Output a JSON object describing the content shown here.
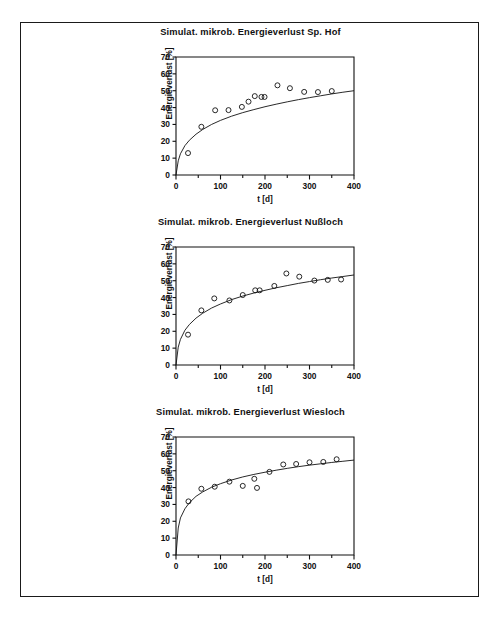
{
  "figure": {
    "border_color": "#1a1a1a",
    "background": "#ffffff",
    "panel_count": 3
  },
  "axis_labels": {
    "x": "t [d]",
    "y": "Energieverlust [%]"
  },
  "chart_data": [
    {
      "type": "scatter",
      "title": "Simulat. mikrob. Energieverlust Sp. Hof",
      "xlabel": "t [d]",
      "ylabel": "Energieverlust [%]",
      "xlim": [
        0,
        400
      ],
      "ylim": [
        0,
        70
      ],
      "xticks": [
        0,
        100,
        200,
        300,
        400
      ],
      "xtick_labels": [
        "0",
        "100",
        "200",
        "300",
        "400"
      ],
      "xminor_step": 50,
      "yticks": [
        0,
        10,
        20,
        30,
        40,
        50,
        60,
        70
      ],
      "ytick_labels": [
        "0",
        "10",
        "20",
        "30",
        "40",
        "50",
        "60",
        "70"
      ],
      "grid": false,
      "legend": "none",
      "marker": "open-circle",
      "points": [
        {
          "x": 27,
          "y": 13.0
        },
        {
          "x": 57,
          "y": 28.6
        },
        {
          "x": 88,
          "y": 38.4
        },
        {
          "x": 118,
          "y": 38.5
        },
        {
          "x": 148,
          "y": 40.4
        },
        {
          "x": 163,
          "y": 43.5
        },
        {
          "x": 177,
          "y": 46.8
        },
        {
          "x": 192,
          "y": 46.3
        },
        {
          "x": 199,
          "y": 46.3
        },
        {
          "x": 228,
          "y": 53.2
        },
        {
          "x": 256,
          "y": 51.5
        },
        {
          "x": 288,
          "y": 49.3
        },
        {
          "x": 319,
          "y": 49.2
        },
        {
          "x": 350,
          "y": 49.8
        }
      ],
      "fit_curve": {
        "label": "model fit",
        "x": [
          0,
          5,
          10,
          20,
          30,
          45,
          60,
          80,
          100,
          125,
          150,
          175,
          200,
          225,
          250,
          275,
          300,
          325,
          350,
          375,
          400
        ],
        "y": [
          0,
          8.4,
          12.6,
          17.4,
          20.6,
          24.2,
          27.0,
          30.0,
          32.4,
          34.9,
          37.0,
          38.8,
          40.5,
          42.0,
          43.4,
          44.7,
          45.9,
          47.0,
          48.1,
          49.1,
          50.0
        ]
      }
    },
    {
      "type": "scatter",
      "title": "Simulat. mikrob. Energieverlust Nußloch",
      "xlabel": "t [d]",
      "ylabel": "Energieverlust [%]",
      "xlim": [
        0,
        400
      ],
      "ylim": [
        0,
        70
      ],
      "xticks": [
        0,
        100,
        200,
        300,
        400
      ],
      "xtick_labels": [
        "0",
        "100",
        "200",
        "300",
        "400"
      ],
      "xminor_step": 50,
      "yticks": [
        0,
        10,
        20,
        30,
        40,
        50,
        60,
        70
      ],
      "ytick_labels": [
        "0",
        "10",
        "20",
        "30",
        "40",
        "50",
        "60",
        "70"
      ],
      "grid": false,
      "legend": "none",
      "marker": "open-circle",
      "points": [
        {
          "x": 27,
          "y": 18.0
        },
        {
          "x": 57,
          "y": 32.4
        },
        {
          "x": 86,
          "y": 39.5
        },
        {
          "x": 120,
          "y": 38.3
        },
        {
          "x": 150,
          "y": 41.5
        },
        {
          "x": 178,
          "y": 44.3
        },
        {
          "x": 188,
          "y": 44.3
        },
        {
          "x": 221,
          "y": 46.9
        },
        {
          "x": 248,
          "y": 54.3
        },
        {
          "x": 277,
          "y": 52.4
        },
        {
          "x": 311,
          "y": 50.1
        },
        {
          "x": 341,
          "y": 50.5
        },
        {
          "x": 371,
          "y": 50.7
        }
      ],
      "fit_curve": {
        "label": "model fit",
        "x": [
          0,
          5,
          10,
          20,
          30,
          45,
          60,
          80,
          100,
          125,
          150,
          175,
          200,
          225,
          250,
          275,
          300,
          325,
          350,
          375,
          400
        ],
        "y": [
          0,
          10.6,
          15.2,
          20.6,
          24.0,
          27.8,
          30.7,
          33.8,
          36.2,
          38.8,
          40.9,
          42.7,
          44.3,
          45.8,
          47.1,
          48.4,
          49.5,
          50.6,
          51.6,
          52.5,
          53.4
        ]
      }
    },
    {
      "type": "scatter",
      "title": "Simulat. mikrob. Energieverlust Wiesloch",
      "xlabel": "t [d]",
      "ylabel": "Energieverlust [%]",
      "xlim": [
        0,
        400
      ],
      "ylim": [
        0,
        70
      ],
      "xticks": [
        0,
        100,
        200,
        300,
        400
      ],
      "xtick_labels": [
        "0",
        "100",
        "200",
        "300",
        "400"
      ],
      "xminor_step": 50,
      "yticks": [
        0,
        10,
        20,
        30,
        40,
        50,
        60,
        70
      ],
      "ytick_labels": [
        "0",
        "10",
        "20",
        "30",
        "40",
        "50",
        "60",
        "70"
      ],
      "grid": false,
      "legend": "none",
      "marker": "open-circle",
      "points": [
        {
          "x": 28,
          "y": 31.8
        },
        {
          "x": 57,
          "y": 39.3
        },
        {
          "x": 87,
          "y": 40.5
        },
        {
          "x": 120,
          "y": 43.5
        },
        {
          "x": 150,
          "y": 41.0
        },
        {
          "x": 176,
          "y": 45.2
        },
        {
          "x": 182,
          "y": 39.8
        },
        {
          "x": 210,
          "y": 49.3
        },
        {
          "x": 241,
          "y": 53.7
        },
        {
          "x": 270,
          "y": 54.0
        },
        {
          "x": 300,
          "y": 55.0
        },
        {
          "x": 331,
          "y": 55.2
        },
        {
          "x": 361,
          "y": 56.8
        }
      ],
      "fit_curve": {
        "label": "model fit",
        "x": [
          0,
          5,
          10,
          20,
          30,
          45,
          60,
          80,
          100,
          125,
          150,
          175,
          200,
          225,
          250,
          275,
          300,
          325,
          350,
          375,
          400
        ],
        "y": [
          0,
          16.0,
          22.0,
          27.4,
          31.0,
          34.8,
          37.4,
          40.2,
          42.3,
          44.5,
          46.3,
          47.8,
          49.1,
          50.3,
          51.4,
          52.4,
          53.3,
          54.1,
          54.9,
          55.6,
          56.3
        ]
      }
    }
  ]
}
